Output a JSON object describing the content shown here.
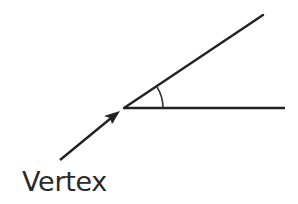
{
  "diagram": {
    "labels": {
      "vertex": "Vertex"
    },
    "colors": {
      "stroke": "#222222",
      "arc": "#333333",
      "text": "#2a2a2a",
      "background": "#ffffff"
    },
    "elements": {
      "vertex_point": [
        124,
        108
      ],
      "ray_upper_end": [
        263,
        15
      ],
      "ray_horizontal_end": [
        285,
        108
      ],
      "angle_arc": "small arc between rays near the vertex",
      "pointer_arrow": {
        "from": [
          60,
          160
        ],
        "to": [
          118,
          113
        ]
      }
    }
  }
}
